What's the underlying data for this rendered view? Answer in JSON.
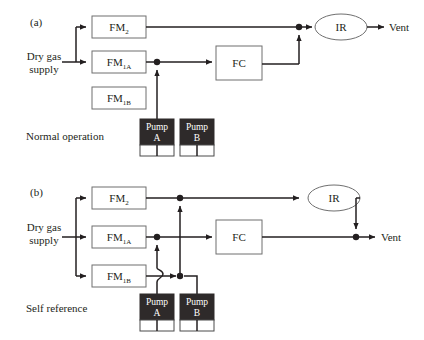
{
  "figure": {
    "background_color": "#ffffff",
    "line_color": "#231f20",
    "box_stroke_color": "#6f6f6f",
    "pump_fill_color": "#2e2a2a",
    "pump_text_color": "#ffffff"
  },
  "panels": [
    {
      "id": "a",
      "tag": "(a)",
      "caption": "Normal operation",
      "source_label_line1": "Dry gas",
      "source_label_line2": "supply",
      "output_label": "Vent",
      "boxes": [
        {
          "name": "fm2",
          "base": "FM",
          "sub": "2",
          "label": "FM2"
        },
        {
          "name": "fm1a",
          "base": "FM",
          "sub": "1A",
          "label": "FM1A"
        },
        {
          "name": "fm1b",
          "base": "FM",
          "sub": "1B",
          "label": "FM1B"
        },
        {
          "name": "fc",
          "base": "FC",
          "sub": "",
          "label": "FC"
        }
      ],
      "analyzer": {
        "name": "ir",
        "label": "IR"
      },
      "pumps": [
        {
          "name": "pump-a",
          "line1": "Pump",
          "line2": "A",
          "active": true
        },
        {
          "name": "pump-b",
          "line1": "Pump",
          "line2": "B",
          "active": false
        }
      ]
    },
    {
      "id": "b",
      "tag": "(b)",
      "caption": "Self reference",
      "source_label_line1": "Dry gas",
      "source_label_line2": "supply",
      "output_label": "Vent",
      "boxes": [
        {
          "name": "fm2",
          "base": "FM",
          "sub": "2",
          "label": "FM2"
        },
        {
          "name": "fm1a",
          "base": "FM",
          "sub": "1A",
          "label": "FM1A"
        },
        {
          "name": "fm1b",
          "base": "FM",
          "sub": "1B",
          "label": "FM1B"
        },
        {
          "name": "fc",
          "base": "FC",
          "sub": "",
          "label": "FC"
        }
      ],
      "analyzer": {
        "name": "ir",
        "label": "IR"
      },
      "pumps": [
        {
          "name": "pump-a",
          "line1": "Pump",
          "line2": "A",
          "active": true
        },
        {
          "name": "pump-b",
          "line1": "Pump",
          "line2": "B",
          "active": true
        }
      ]
    }
  ]
}
